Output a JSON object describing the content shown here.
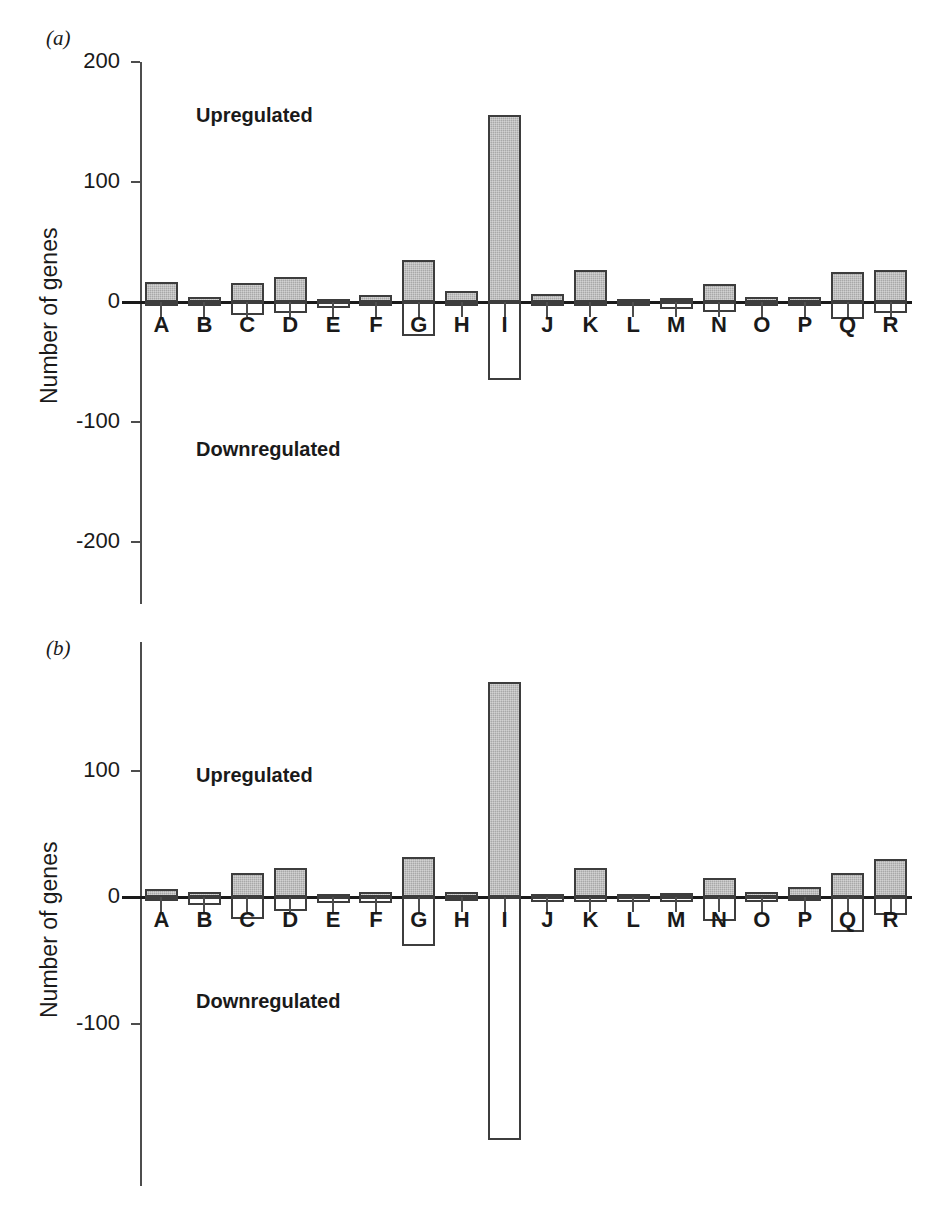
{
  "figure": {
    "background_color": "#ffffff",
    "upregulated_fill": "#a8a8a8",
    "downregulated_fill": "#ffffff",
    "outline_color": "#3d3d3d"
  },
  "panels": [
    {
      "id": "a",
      "letter": "(a)",
      "ylabel": "Number of genes",
      "upregulated_label": "Upregulated",
      "downregulated_label": "Downregulated",
      "yticks": [
        200,
        100,
        0,
        -100,
        -200
      ],
      "ytick_labels": [
        "200",
        "100",
        "0",
        "-100",
        "-200"
      ]
    },
    {
      "id": "b",
      "letter": "(b)",
      "ylabel": "Number of genes",
      "upregulated_label": "Upregulated",
      "downregulated_label": "Downregulated",
      "yticks": [
        100,
        0,
        -100
      ],
      "ytick_labels": [
        "100",
        "0",
        "-100"
      ]
    }
  ],
  "chart_data": [
    {
      "type": "bar",
      "panel": "a",
      "title": "",
      "xlabel": "",
      "ylabel": "Number of genes",
      "ylim": [
        -260,
        200
      ],
      "grid": false,
      "legend": false,
      "annotations": [
        "Upregulated",
        "Downregulated"
      ],
      "categories": [
        "A",
        "B",
        "C",
        "D",
        "E",
        "F",
        "G",
        "H",
        "I",
        "J",
        "K",
        "L",
        "M",
        "N",
        "O",
        "P",
        "Q",
        "R"
      ],
      "series": [
        {
          "name": "Upregulated",
          "values": [
            17,
            4,
            16,
            21,
            2,
            6,
            35,
            9,
            156,
            7,
            27,
            2,
            3,
            15,
            4,
            4,
            25,
            27
          ]
        },
        {
          "name": "Downregulated",
          "values": [
            -3,
            -2,
            -11,
            -9,
            -5,
            -2,
            -28,
            -2,
            -65,
            -2,
            -3,
            -2,
            -6,
            -8,
            -2,
            -2,
            -14,
            -9
          ]
        }
      ]
    },
    {
      "type": "bar",
      "panel": "b",
      "title": "",
      "xlabel": "",
      "ylabel": "Number of genes",
      "ylim": [
        -215,
        190
      ],
      "grid": false,
      "legend": false,
      "annotations": [
        "Upregulated",
        "Downregulated"
      ],
      "categories": [
        "A",
        "B",
        "C",
        "D",
        "E",
        "F",
        "G",
        "H",
        "I",
        "J",
        "K",
        "L",
        "M",
        "N",
        "O",
        "P",
        "Q",
        "R"
      ],
      "series": [
        {
          "name": "Upregulated",
          "values": [
            6,
            4,
            19,
            23,
            2,
            4,
            32,
            4,
            170,
            1,
            23,
            2,
            3,
            15,
            4,
            8,
            19,
            30
          ]
        },
        {
          "name": "Downregulated",
          "values": [
            -3,
            -6,
            -17,
            -11,
            -5,
            -5,
            -39,
            -3,
            -192,
            -4,
            -4,
            -4,
            -4,
            -19,
            -4,
            -2,
            -28,
            -14
          ]
        }
      ]
    }
  ]
}
